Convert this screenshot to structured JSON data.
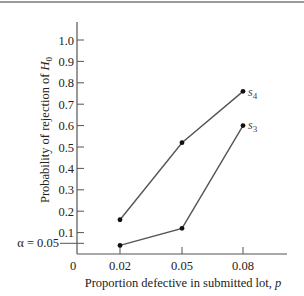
{
  "chart_data": {
    "type": "line",
    "title": "",
    "xlabel": "Proportion defective in submitted lot, p",
    "ylabel": "Probability of rejection of H0",
    "x": [
      0.02,
      0.05,
      0.08
    ],
    "x_tick_labels": [
      "0",
      "0.02",
      "0.05",
      "0.08"
    ],
    "y_tick_labels": [
      "0.1",
      "0.2",
      "0.3",
      "0.4",
      "0.5",
      "0.6",
      "0.7",
      "0.8",
      "0.9",
      "1.0"
    ],
    "y_ticks": [
      0.1,
      0.2,
      0.3,
      0.4,
      0.5,
      0.6,
      0.7,
      0.8,
      0.9,
      1.0
    ],
    "ylim": [
      0,
      1.0
    ],
    "grid": false,
    "annotations": [
      {
        "text": "α = 0.05",
        "y": 0.05,
        "position": "left-of-y-axis"
      }
    ],
    "series": [
      {
        "name": "s4",
        "values": [
          0.16,
          0.52,
          0.76
        ]
      },
      {
        "name": "s3",
        "values": [
          0.04,
          0.12,
          0.6
        ]
      }
    ],
    "legend": "inline labels at line ends"
  },
  "labels": {
    "xlabel_main": "Proportion defective in submitted lot, ",
    "xlabel_var": "p",
    "ylabel_main": "Probability of rejection of ",
    "ylabel_var": "H",
    "ylabel_sub": "0",
    "alpha_label": "α = 0.05",
    "origin_label": "0",
    "series_s4_base": "s",
    "series_s4_sub": "4",
    "series_s3_base": "s",
    "series_s3_sub": "3"
  }
}
